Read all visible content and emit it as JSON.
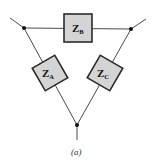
{
  "diagram": {
    "type": "delta-impedance-network",
    "impedances": [
      {
        "id": "B",
        "symbol": "Z",
        "subscript": "B",
        "position": "top"
      },
      {
        "id": "A",
        "symbol": "Z",
        "subscript": "A",
        "position": "left"
      },
      {
        "id": "C",
        "symbol": "Z",
        "subscript": "C",
        "position": "right"
      }
    ],
    "caption": "(a)",
    "colors": {
      "box_fill": "#d4d4d4",
      "box_stroke": "#2a2a2a",
      "wire": "#4a4a4a",
      "node": "#111111"
    }
  }
}
